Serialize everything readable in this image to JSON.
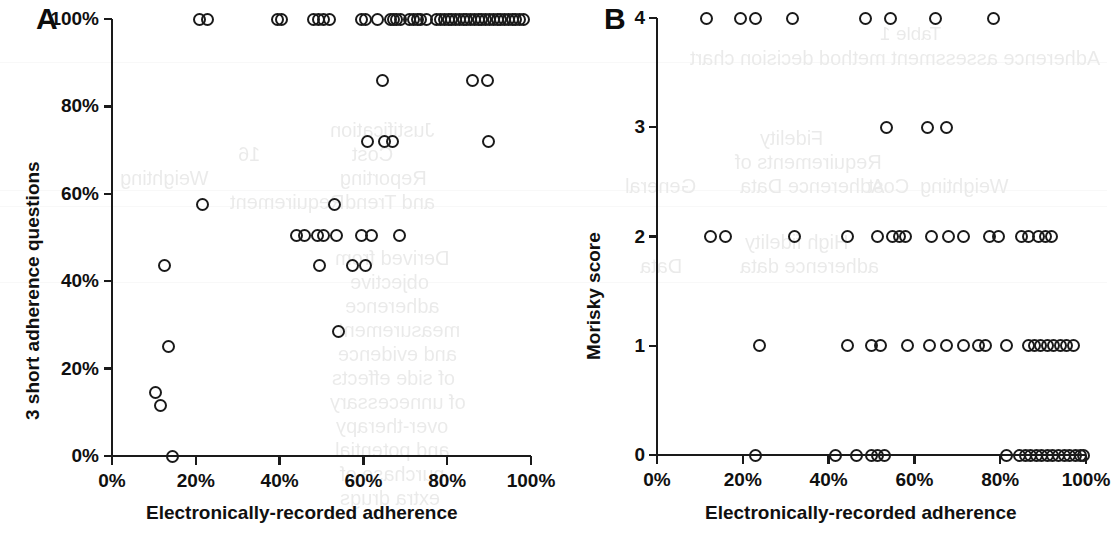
{
  "figure": {
    "panels": [
      {
        "letter": "A",
        "xlabel": "Electronically-recorded adherence",
        "ylabel": "3 short adherence questions",
        "xticks": [
          "0%",
          "20%",
          "40%",
          "60%",
          "80%",
          "100%"
        ],
        "yticks": [
          "0%",
          "20%",
          "40%",
          "60%",
          "80%",
          "100%"
        ]
      },
      {
        "letter": "B",
        "xlabel": "Electronically-recorded adherence",
        "ylabel": "Morisky score",
        "xticks": [
          "0%",
          "20%",
          "40%",
          "60%",
          "80%",
          "100%"
        ],
        "yticks": [
          "0",
          "1",
          "2",
          "3",
          "4"
        ]
      }
    ]
  },
  "colors": {
    "ink": "#1a1a1a",
    "marker_stroke": "#1a1a1a",
    "background": "#ffffff",
    "ghost_text": "#8a8a86"
  },
  "chart_data": [
    {
      "type": "scatter",
      "panel": "A",
      "title": "",
      "xlabel": "Electronically-recorded adherence",
      "ylabel": "3 short adherence questions",
      "xlim": [
        0,
        100
      ],
      "ylim": [
        0,
        100
      ],
      "xticks": [
        0,
        20,
        40,
        60,
        80,
        100
      ],
      "yticks": [
        0,
        20,
        40,
        60,
        80,
        100
      ],
      "xtick_labels": [
        "0%",
        "20%",
        "40%",
        "60%",
        "80%",
        "100%"
      ],
      "ytick_labels": [
        "0%",
        "20%",
        "40%",
        "60%",
        "80%",
        "100%"
      ],
      "grid": false,
      "legend": null,
      "marker": "open-circle",
      "points": [
        {
          "x": 21.0,
          "y": 100
        },
        {
          "x": 22.8,
          "y": 100
        },
        {
          "x": 39.5,
          "y": 100
        },
        {
          "x": 40.4,
          "y": 100
        },
        {
          "x": 48.0,
          "y": 100
        },
        {
          "x": 49.3,
          "y": 100
        },
        {
          "x": 50.5,
          "y": 100
        },
        {
          "x": 51.8,
          "y": 100
        },
        {
          "x": 59.5,
          "y": 100
        },
        {
          "x": 60.6,
          "y": 100
        },
        {
          "x": 63.3,
          "y": 100
        },
        {
          "x": 66.4,
          "y": 100
        },
        {
          "x": 67.2,
          "y": 100
        },
        {
          "x": 68.0,
          "y": 100
        },
        {
          "x": 68.9,
          "y": 100
        },
        {
          "x": 71.0,
          "y": 100
        },
        {
          "x": 71.9,
          "y": 100
        },
        {
          "x": 72.8,
          "y": 100
        },
        {
          "x": 73.6,
          "y": 100
        },
        {
          "x": 75.0,
          "y": 100
        },
        {
          "x": 77.5,
          "y": 100
        },
        {
          "x": 78.4,
          "y": 100
        },
        {
          "x": 79.3,
          "y": 100
        },
        {
          "x": 80.2,
          "y": 100
        },
        {
          "x": 81.1,
          "y": 100
        },
        {
          "x": 82.0,
          "y": 100
        },
        {
          "x": 82.9,
          "y": 100
        },
        {
          "x": 83.8,
          "y": 100
        },
        {
          "x": 84.7,
          "y": 100
        },
        {
          "x": 85.6,
          "y": 100
        },
        {
          "x": 86.5,
          "y": 100
        },
        {
          "x": 87.4,
          "y": 100
        },
        {
          "x": 88.3,
          "y": 100
        },
        {
          "x": 89.2,
          "y": 100
        },
        {
          "x": 90.1,
          "y": 100
        },
        {
          "x": 91.0,
          "y": 100
        },
        {
          "x": 91.9,
          "y": 100
        },
        {
          "x": 92.8,
          "y": 100
        },
        {
          "x": 93.7,
          "y": 100
        },
        {
          "x": 94.6,
          "y": 100
        },
        {
          "x": 95.5,
          "y": 100
        },
        {
          "x": 96.4,
          "y": 100
        },
        {
          "x": 97.3,
          "y": 100
        },
        {
          "x": 98.2,
          "y": 100
        },
        {
          "x": 64.5,
          "y": 86
        },
        {
          "x": 86.0,
          "y": 86
        },
        {
          "x": 89.5,
          "y": 86
        },
        {
          "x": 61.0,
          "y": 72
        },
        {
          "x": 65.0,
          "y": 72
        },
        {
          "x": 67.0,
          "y": 72
        },
        {
          "x": 89.8,
          "y": 72
        },
        {
          "x": 21.5,
          "y": 57.5
        },
        {
          "x": 53.0,
          "y": 57.5
        },
        {
          "x": 44.0,
          "y": 50.5
        },
        {
          "x": 46.0,
          "y": 50.5
        },
        {
          "x": 49.0,
          "y": 50.5
        },
        {
          "x": 50.5,
          "y": 50.5
        },
        {
          "x": 53.5,
          "y": 50.5
        },
        {
          "x": 59.5,
          "y": 50.5
        },
        {
          "x": 62.0,
          "y": 50.5
        },
        {
          "x": 68.5,
          "y": 50.5
        },
        {
          "x": 12.5,
          "y": 43.5
        },
        {
          "x": 49.5,
          "y": 43.5
        },
        {
          "x": 57.5,
          "y": 43.5
        },
        {
          "x": 60.5,
          "y": 43.5
        },
        {
          "x": 54.0,
          "y": 28.5
        },
        {
          "x": 13.5,
          "y": 25.0
        },
        {
          "x": 10.3,
          "y": 14.5
        },
        {
          "x": 11.5,
          "y": 11.5
        },
        {
          "x": 14.5,
          "y": 0
        }
      ]
    },
    {
      "type": "scatter",
      "panel": "B",
      "title": "",
      "xlabel": "Electronically-recorded adherence",
      "ylabel": "Morisky score",
      "xlim": [
        0,
        100
      ],
      "ylim": [
        0,
        4
      ],
      "xticks": [
        0,
        20,
        40,
        60,
        80,
        100
      ],
      "yticks": [
        0,
        1,
        2,
        3,
        4
      ],
      "xtick_labels": [
        "0%",
        "20%",
        "40%",
        "60%",
        "80%",
        "100%"
      ],
      "ytick_labels": [
        "0",
        "1",
        "2",
        "3",
        "4"
      ],
      "grid": false,
      "legend": null,
      "marker": "open-circle",
      "points": [
        {
          "x": 11.5,
          "y": 4
        },
        {
          "x": 19.5,
          "y": 4
        },
        {
          "x": 23.0,
          "y": 4
        },
        {
          "x": 31.5,
          "y": 4
        },
        {
          "x": 48.5,
          "y": 4
        },
        {
          "x": 54.5,
          "y": 4
        },
        {
          "x": 65.0,
          "y": 4
        },
        {
          "x": 78.5,
          "y": 4
        },
        {
          "x": 53.5,
          "y": 3
        },
        {
          "x": 63.0,
          "y": 3
        },
        {
          "x": 67.5,
          "y": 3
        },
        {
          "x": 12.5,
          "y": 2
        },
        {
          "x": 16.0,
          "y": 2
        },
        {
          "x": 32.0,
          "y": 2
        },
        {
          "x": 44.5,
          "y": 2
        },
        {
          "x": 51.5,
          "y": 2
        },
        {
          "x": 55.0,
          "y": 2
        },
        {
          "x": 56.5,
          "y": 2
        },
        {
          "x": 58.0,
          "y": 2
        },
        {
          "x": 64.0,
          "y": 2
        },
        {
          "x": 68.0,
          "y": 2
        },
        {
          "x": 71.5,
          "y": 2
        },
        {
          "x": 77.5,
          "y": 2
        },
        {
          "x": 79.5,
          "y": 2
        },
        {
          "x": 85.0,
          "y": 2
        },
        {
          "x": 86.5,
          "y": 2
        },
        {
          "x": 89.0,
          "y": 2
        },
        {
          "x": 90.5,
          "y": 2
        },
        {
          "x": 92.0,
          "y": 2
        },
        {
          "x": 24.0,
          "y": 1
        },
        {
          "x": 44.5,
          "y": 1
        },
        {
          "x": 50.0,
          "y": 1
        },
        {
          "x": 52.0,
          "y": 1
        },
        {
          "x": 58.5,
          "y": 1
        },
        {
          "x": 63.5,
          "y": 1
        },
        {
          "x": 67.5,
          "y": 1
        },
        {
          "x": 71.5,
          "y": 1
        },
        {
          "x": 75.0,
          "y": 1
        },
        {
          "x": 76.5,
          "y": 1
        },
        {
          "x": 81.5,
          "y": 1
        },
        {
          "x": 86.5,
          "y": 1
        },
        {
          "x": 88.0,
          "y": 1
        },
        {
          "x": 89.5,
          "y": 1
        },
        {
          "x": 91.0,
          "y": 1
        },
        {
          "x": 92.5,
          "y": 1
        },
        {
          "x": 94.0,
          "y": 1
        },
        {
          "x": 95.5,
          "y": 1
        },
        {
          "x": 97.0,
          "y": 1
        },
        {
          "x": 23.0,
          "y": 0
        },
        {
          "x": 41.5,
          "y": 0
        },
        {
          "x": 46.5,
          "y": 0
        },
        {
          "x": 50.0,
          "y": 0
        },
        {
          "x": 51.5,
          "y": 0
        },
        {
          "x": 53.0,
          "y": 0
        },
        {
          "x": 81.5,
          "y": 0
        },
        {
          "x": 84.5,
          "y": 0
        },
        {
          "x": 85.8,
          "y": 0
        },
        {
          "x": 87.1,
          "y": 0
        },
        {
          "x": 88.4,
          "y": 0
        },
        {
          "x": 89.7,
          "y": 0
        },
        {
          "x": 91.0,
          "y": 0
        },
        {
          "x": 92.3,
          "y": 0
        },
        {
          "x": 93.6,
          "y": 0
        },
        {
          "x": 94.9,
          "y": 0
        },
        {
          "x": 96.2,
          "y": 0
        },
        {
          "x": 97.5,
          "y": 0
        },
        {
          "x": 98.8,
          "y": 0
        },
        {
          "x": 99.5,
          "y": 0
        }
      ]
    }
  ],
  "bleed_through": {
    "note": "Mirrored text showing through from the reverse side of the scanned page",
    "lines": [
      {
        "text": "Table 1",
        "x": 880,
        "y": 24,
        "size": 19,
        "serif": false
      },
      {
        "text": "Adherence assessment method decision chart",
        "x": 690,
        "y": 48,
        "size": 20,
        "serif": false
      },
      {
        "text": "Fidelity",
        "x": 760,
        "y": 128,
        "size": 20,
        "serif": false
      },
      {
        "text": "Requirements of",
        "x": 735,
        "y": 152,
        "size": 20,
        "serif": false
      },
      {
        "text": "Adherence Data",
        "x": 740,
        "y": 176,
        "size": 20,
        "serif": false
      },
      {
        "text": "Cost",
        "x": 868,
        "y": 176,
        "size": 20,
        "serif": false
      },
      {
        "text": "Weighting",
        "x": 920,
        "y": 176,
        "size": 20,
        "serif": false
      },
      {
        "text": "General",
        "x": 625,
        "y": 176,
        "size": 20,
        "serif": false
      },
      {
        "text": "High fidelity",
        "x": 745,
        "y": 232,
        "size": 20,
        "serif": false
      },
      {
        "text": "adherence data",
        "x": 740,
        "y": 256,
        "size": 20,
        "serif": false
      },
      {
        "text": "Data",
        "x": 640,
        "y": 256,
        "size": 20,
        "serif": false
      },
      {
        "text": "Justification",
        "x": 330,
        "y": 120,
        "size": 20,
        "serif": false
      },
      {
        "text": "Cost",
        "x": 352,
        "y": 144,
        "size": 20,
        "serif": false
      },
      {
        "text": "16",
        "x": 238,
        "y": 144,
        "size": 20,
        "serif": false
      },
      {
        "text": "Reporting",
        "x": 340,
        "y": 168,
        "size": 20,
        "serif": false
      },
      {
        "text": "Weighting",
        "x": 120,
        "y": 168,
        "size": 20,
        "serif": false
      },
      {
        "text": "and Trend",
        "x": 345,
        "y": 192,
        "size": 20,
        "serif": false
      },
      {
        "text": "Requirement",
        "x": 230,
        "y": 192,
        "size": 20,
        "serif": false
      },
      {
        "text": "Derived from",
        "x": 335,
        "y": 248,
        "size": 20,
        "serif": false
      },
      {
        "text": "objective",
        "x": 350,
        "y": 272,
        "size": 20,
        "serif": false
      },
      {
        "text": "adherence",
        "x": 345,
        "y": 296,
        "size": 20,
        "serif": false
      },
      {
        "text": "measurement",
        "x": 338,
        "y": 320,
        "size": 20,
        "serif": false
      },
      {
        "text": "and evidence",
        "x": 338,
        "y": 344,
        "size": 20,
        "serif": false
      },
      {
        "text": "of side effects",
        "x": 332,
        "y": 368,
        "size": 20,
        "serif": false
      },
      {
        "text": "of unnecessary",
        "x": 330,
        "y": 392,
        "size": 20,
        "serif": false
      },
      {
        "text": "over-therapy",
        "x": 336,
        "y": 416,
        "size": 20,
        "serif": false
      },
      {
        "text": "and potential",
        "x": 335,
        "y": 440,
        "size": 20,
        "serif": false
      },
      {
        "text": "purchase of",
        "x": 340,
        "y": 464,
        "size": 20,
        "serif": false
      },
      {
        "text": "extra drugs",
        "x": 340,
        "y": 488,
        "size": 20,
        "serif": false
      }
    ],
    "rules": [
      {
        "x": 0,
        "y": 62,
        "w": 1107
      },
      {
        "x": 0,
        "y": 190,
        "w": 1107
      },
      {
        "x": 0,
        "y": 206,
        "w": 1107
      },
      {
        "x": 0,
        "y": 282,
        "w": 1107
      }
    ]
  }
}
